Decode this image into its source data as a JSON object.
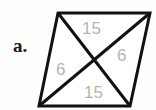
{
  "figure": {
    "part_label": "a.",
    "shape": "parallelogram",
    "stroke_color": "#111111",
    "fill_color": "#ffffff",
    "background_color": "#fefefe",
    "label_color": "#b5b5b5",
    "part_label_color": "#1a1a1a",
    "vertices": {
      "top_left": {
        "x": 58,
        "y": 13
      },
      "top_right": {
        "x": 150,
        "y": 13
      },
      "bottom_right": {
        "x": 130,
        "y": 106
      },
      "bottom_left": {
        "x": 39,
        "y": 106
      }
    },
    "diagonal_intersection": {
      "x": 94,
      "y": 60
    },
    "segment_labels": [
      {
        "id": "top-15",
        "text": "15",
        "position": "upper-middle",
        "x": 82,
        "y": 20
      },
      {
        "id": "right-6",
        "text": "6",
        "position": "right-middle",
        "x": 117,
        "y": 47
      },
      {
        "id": "left-6",
        "text": "6",
        "position": "left-middle",
        "x": 56,
        "y": 61
      },
      {
        "id": "bottom-15",
        "text": "15",
        "position": "lower-middle",
        "x": 84,
        "y": 84
      }
    ]
  }
}
